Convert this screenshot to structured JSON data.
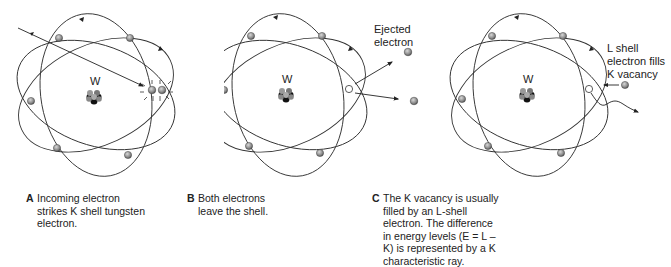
{
  "figure": {
    "element_symbol": "W",
    "panels": [
      {
        "id": "A",
        "letter": "A",
        "caption": "Incoming electron strikes K shell tungsten electron.",
        "annotation": ""
      },
      {
        "id": "B",
        "letter": "B",
        "caption": "Both electrons leave the shell.",
        "annotation_line1": "Ejected",
        "annotation_line2": "electron"
      },
      {
        "id": "C",
        "letter": "C",
        "caption": "The K vacancy is usually filled by an L-shell electron. The difference in energy levels (E = L – K) is represented by a K characteristic ray.",
        "annotation_line1": "L shell",
        "annotation_line2": "electron fills",
        "annotation_line3": "K vacancy"
      }
    ],
    "colors": {
      "orbit": "#333333",
      "electron": "#8a8a8a",
      "nucleus_dark": "#111111",
      "nucleus_light": "#999999",
      "vacancy": "#ffffff"
    }
  }
}
